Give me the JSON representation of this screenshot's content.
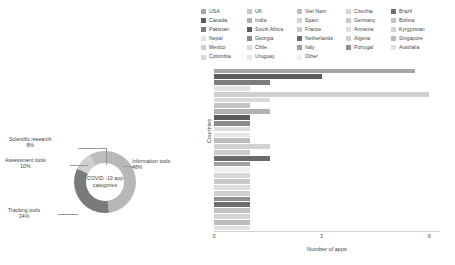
{
  "legend": {
    "columns": [
      [
        {
          "label": "USA",
          "color": "#a6a6a6"
        },
        {
          "label": "Canada",
          "color": "#5c5c5c"
        },
        {
          "label": "Pakistan",
          "color": "#7d7d7d"
        },
        {
          "label": "Nepal",
          "color": "#e2e2e2"
        },
        {
          "label": "Mexico",
          "color": "#cfcfcf"
        },
        {
          "label": "Colombia",
          "color": "#d9d9d9"
        }
      ],
      [
        {
          "label": "UK",
          "color": "#c4c4c4"
        },
        {
          "label": "India",
          "color": "#b0b0b0"
        },
        {
          "label": "South Africa",
          "color": "#5a5a5a"
        },
        {
          "label": "Georgia",
          "color": "#8a8a8a"
        },
        {
          "label": "Chile",
          "color": "#dcdcdc"
        },
        {
          "label": "Uruguay",
          "color": "#e6e6e6"
        }
      ],
      [
        {
          "label": "Viet Nam",
          "color": "#bdbdbd"
        },
        {
          "label": "Spain",
          "color": "#d2d2d2"
        },
        {
          "label": "France",
          "color": "#cccccc"
        },
        {
          "label": "Netherlands",
          "color": "#6a6a6a"
        },
        {
          "label": "Italy",
          "color": "#9f9f9f"
        },
        {
          "label": "Other",
          "color": "#efefef"
        }
      ],
      [
        {
          "label": "Czechia",
          "color": "#d6d6d6"
        },
        {
          "label": "Germany",
          "color": "#c9c9c9"
        },
        {
          "label": "Armenia",
          "color": "#dedede"
        },
        {
          "label": "Algeria",
          "color": "#cfcfcf"
        },
        {
          "label": "Portugal",
          "color": "#8f8f8f"
        }
      ],
      [
        {
          "label": "Brazil",
          "color": "#6f6f6f"
        },
        {
          "label": "Bolivia",
          "color": "#c2c2c2"
        },
        {
          "label": "Kyrgyzstan",
          "color": "#d4d4d4"
        },
        {
          "label": "Singapore",
          "color": "#bbbbbb"
        },
        {
          "label": "Australia",
          "color": "#e0e0e0"
        }
      ]
    ]
  },
  "chart_data": [
    {
      "type": "bar",
      "orientation": "horizontal",
      "title": "",
      "xlabel": "Number of apps",
      "ylabel": "Countries",
      "xlim": [
        0,
        6.3
      ],
      "xticks": [
        0,
        3,
        6
      ],
      "xticklabels": [
        "0",
        "3",
        "6"
      ],
      "grid": false,
      "legend_position": "top",
      "categories": [
        "USA",
        "Canada",
        "Pakistan",
        "Nepal",
        "Mexico",
        "Colombia",
        "UK",
        "India",
        "South Africa",
        "Georgia",
        "Chile",
        "Uruguay",
        "Viet Nam",
        "Spain",
        "France",
        "Netherlands",
        "Italy",
        "Other",
        "Czechia",
        "Germany",
        "Armenia",
        "Algeria",
        "Portugal",
        "Brazil",
        "Bolivia",
        "Kyrgyzstan",
        "Singapore",
        "Australia"
      ],
      "values": [
        5.6,
        3.0,
        1.55,
        1.0,
        6.0,
        1.55,
        1.0,
        1.55,
        1.0,
        1.0,
        1.0,
        1.0,
        1.0,
        1.55,
        1.0,
        1.55,
        1.0,
        1.0,
        1.0,
        1.0,
        1.0,
        1.0,
        1.0,
        1.0,
        1.0,
        1.0,
        1.0,
        1.0
      ],
      "colors": [
        "#a6a6a6",
        "#5c5c5c",
        "#7d7d7d",
        "#e2e2e2",
        "#cfcfcf",
        "#d9d9d9",
        "#c4c4c4",
        "#b0b0b0",
        "#5a5a5a",
        "#8a8a8a",
        "#dcdcdc",
        "#e6e6e6",
        "#bdbdbd",
        "#d2d2d2",
        "#cccccc",
        "#6a6a6a",
        "#9f9f9f",
        "#efefef",
        "#d6d6d6",
        "#c9c9c9",
        "#dedede",
        "#cfcfcf",
        "#8f8f8f",
        "#6f6f6f",
        "#c2c2c2",
        "#d4d4d4",
        "#bbbbbb",
        "#e0e0e0"
      ]
    },
    {
      "type": "pie",
      "variant": "donut",
      "title": "",
      "center_label_line1": "COVID -19 app",
      "center_label_line2": "categories",
      "labels": [
        "Information tools",
        "Tracking tools",
        "Assessment tools",
        "Scientific research"
      ],
      "values": [
        48,
        34,
        10,
        8
      ],
      "value_suffix": "%",
      "colors": [
        "#b7b7b7",
        "#7a7a7a",
        "#cfcfcf",
        "#bdbdbd"
      ],
      "annotations": [
        {
          "name": "information-tools",
          "label": "Information tools",
          "value": "48%"
        },
        {
          "name": "tracking-tools",
          "label": "Tracking tools",
          "value": "34%"
        },
        {
          "name": "assessment-tools",
          "label": "Assessment tools",
          "value": "10%"
        },
        {
          "name": "scientific-research",
          "label": "Scientific research",
          "value": "8%"
        }
      ]
    }
  ]
}
